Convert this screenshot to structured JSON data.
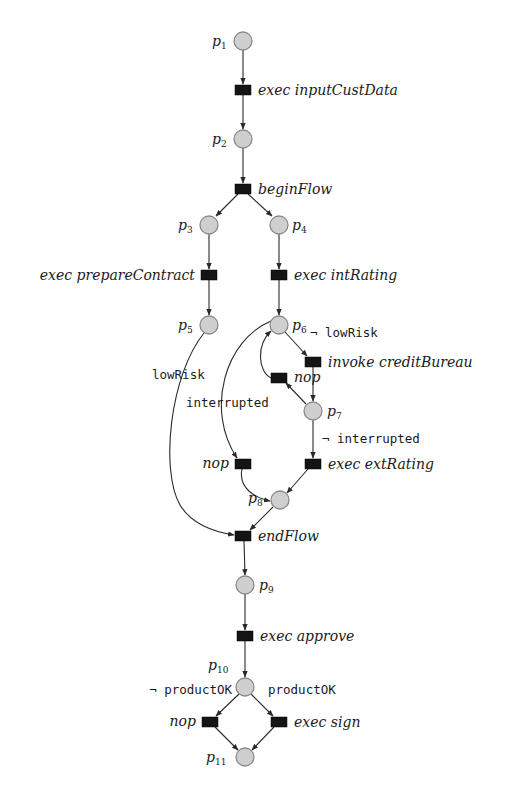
{
  "diagram": {
    "colors": {
      "place_fill": "#cfcfcf",
      "place_stroke": "#8a8a8a",
      "transition_fill": "#141414",
      "arc": "#2a2a2a"
    },
    "places": [
      {
        "id": "p1",
        "base": "p",
        "sub": "1",
        "x": 243,
        "y": 41
      },
      {
        "id": "p2",
        "base": "p",
        "sub": "2",
        "x": 243,
        "y": 139
      },
      {
        "id": "p3",
        "base": "p",
        "sub": "3",
        "x": 209,
        "y": 225
      },
      {
        "id": "p4",
        "base": "p",
        "sub": "4",
        "x": 279,
        "y": 225
      },
      {
        "id": "p5",
        "base": "p",
        "sub": "5",
        "x": 209,
        "y": 325
      },
      {
        "id": "p6",
        "base": "p",
        "sub": "6",
        "x": 279,
        "y": 325
      },
      {
        "id": "p7",
        "base": "p",
        "sub": "7",
        "x": 313,
        "y": 411
      },
      {
        "id": "p8",
        "base": "p",
        "sub": "8",
        "x": 280,
        "y": 500
      },
      {
        "id": "p9",
        "base": "p",
        "sub": "9",
        "x": 245,
        "y": 585
      },
      {
        "id": "p10",
        "base": "p",
        "sub": "10",
        "x": 245,
        "y": 687
      },
      {
        "id": "p11",
        "base": "p",
        "sub": "11",
        "x": 245,
        "y": 757
      }
    ],
    "transitions": [
      {
        "id": "t_inputCustData",
        "label": "exec inputCustData",
        "x": 243,
        "y": 90
      },
      {
        "id": "t_beginFlow",
        "label": "beginFlow",
        "x": 243,
        "y": 189
      },
      {
        "id": "t_prepareContract",
        "label": "exec prepareContract",
        "x": 209,
        "y": 275
      },
      {
        "id": "t_intRating",
        "label": "exec intRating",
        "x": 279,
        "y": 275
      },
      {
        "id": "t_creditBureau",
        "label": "invoke creditBureau",
        "x": 313,
        "y": 362
      },
      {
        "id": "t_nop_loop",
        "label": "nop",
        "x": 279,
        "y": 378
      },
      {
        "id": "t_nop_interrupt",
        "label": "nop",
        "x": 243,
        "y": 464
      },
      {
        "id": "t_extRating",
        "label": "exec extRating",
        "x": 313,
        "y": 464
      },
      {
        "id": "t_endFlow",
        "label": "endFlow",
        "x": 243,
        "y": 536
      },
      {
        "id": "t_approve",
        "label": "exec approve",
        "x": 245,
        "y": 636
      },
      {
        "id": "t_nop_final",
        "label": "nop",
        "x": 210,
        "y": 722
      },
      {
        "id": "t_sign",
        "label": "exec sign",
        "x": 279,
        "y": 722
      }
    ],
    "guards": [
      {
        "id": "g_not_lowRisk",
        "text": "¬ lowRisk"
      },
      {
        "id": "g_lowRisk",
        "text": "lowRisk"
      },
      {
        "id": "g_interrupted",
        "text": "interrupted"
      },
      {
        "id": "g_not_interrupted",
        "text": "¬ interrupted"
      },
      {
        "id": "g_not_productOK",
        "text": "¬ productOK"
      },
      {
        "id": "g_productOK",
        "text": "productOK"
      }
    ]
  }
}
